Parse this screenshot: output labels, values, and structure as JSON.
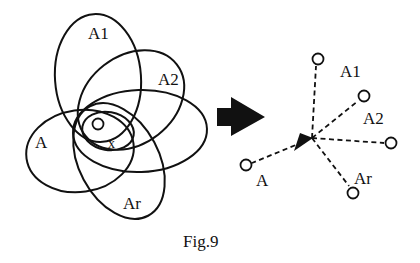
{
  "figure": {
    "caption": "Fig.9",
    "colors": {
      "ink": "#111111",
      "background": "#ffffff"
    }
  },
  "left_diagram": {
    "ellipses": [
      {
        "label": "A1",
        "cx": 98,
        "cy": 78,
        "rx": 43,
        "ry": 64,
        "rotate": -4
      },
      {
        "label": "A2",
        "cx": 131,
        "cy": 100,
        "rx": 58,
        "ry": 44,
        "rotate": -38
      },
      {
        "label": "",
        "cx": 140,
        "cy": 131,
        "rx": 67,
        "ry": 41,
        "rotate": -2
      },
      {
        "label": "A",
        "cx": 80,
        "cy": 151,
        "rx": 54,
        "ry": 41,
        "rotate": -8
      },
      {
        "label": "Ar",
        "cx": 119,
        "cy": 161,
        "rx": 40,
        "ry": 62,
        "rotate": -28
      },
      {
        "label": "",
        "cx": 108,
        "cy": 131,
        "rx": 26,
        "ry": 19,
        "rotate": 10
      }
    ],
    "labels": {
      "A1": "A1",
      "A2": "A2",
      "A": "A",
      "Ar": "Ar",
      "origin": "O",
      "x": "x"
    }
  },
  "transform_arrow": {
    "direction": "right"
  },
  "right_diagram": {
    "center": {
      "x": 312,
      "y": 138
    },
    "nodes": [
      {
        "id": "A1",
        "label": "A1",
        "x": 318,
        "y": 59
      },
      {
        "id": "A2",
        "label": "A2",
        "x": 364,
        "y": 96
      },
      {
        "id": "E",
        "label": "",
        "x": 391,
        "y": 143
      },
      {
        "id": "Ar",
        "label": "Ar",
        "x": 353,
        "y": 193
      },
      {
        "id": "A",
        "label": "A",
        "x": 246,
        "y": 165
      }
    ],
    "labels": {
      "A1": "A1",
      "A2": "A2",
      "Ar": "Ar",
      "A": "A"
    }
  }
}
